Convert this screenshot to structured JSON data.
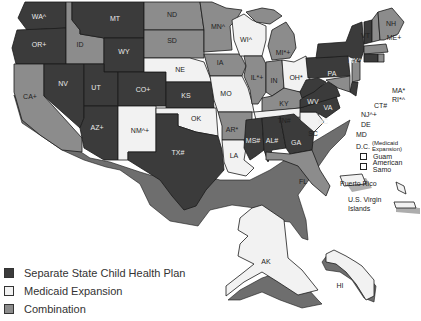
{
  "colors": {
    "separate": "#3b3b3b",
    "medicaid": "#f2f2f2",
    "combination": "#8c8c8c",
    "edge": "#1a1a1a",
    "side_shade": "#6e6e6e"
  },
  "legend": {
    "items": [
      {
        "key": "separate",
        "label": "Separate State Child Health Plan"
      },
      {
        "key": "medicaid",
        "label": "Medicaid Expansion"
      },
      {
        "key": "combination",
        "label": "Combination"
      }
    ]
  },
  "states": [
    {
      "code": "WA",
      "label": "WA^",
      "type": "separate"
    },
    {
      "code": "OR",
      "label": "OR+",
      "type": "separate"
    },
    {
      "code": "CA",
      "label": "CA+",
      "type": "combination"
    },
    {
      "code": "ID",
      "label": "ID",
      "type": "combination"
    },
    {
      "code": "NV",
      "label": "NV",
      "type": "separate"
    },
    {
      "code": "MT",
      "label": "MT",
      "type": "separate"
    },
    {
      "code": "WY",
      "label": "WY",
      "type": "separate"
    },
    {
      "code": "UT",
      "label": "UT",
      "type": "separate"
    },
    {
      "code": "AZ",
      "label": "AZ+",
      "type": "separate"
    },
    {
      "code": "CO",
      "label": "CO+",
      "type": "separate"
    },
    {
      "code": "NM",
      "label": "NM^+",
      "type": "medicaid"
    },
    {
      "code": "ND",
      "label": "ND",
      "type": "combination"
    },
    {
      "code": "SD",
      "label": "SD",
      "type": "combination"
    },
    {
      "code": "NE",
      "label": "NE",
      "type": "medicaid"
    },
    {
      "code": "KS",
      "label": "KS",
      "type": "separate"
    },
    {
      "code": "OK",
      "label": "OK",
      "type": "medicaid"
    },
    {
      "code": "TX",
      "label": "TX#",
      "type": "separate"
    },
    {
      "code": "MN",
      "label": "MN^",
      "type": "combination"
    },
    {
      "code": "IA",
      "label": "IA",
      "type": "combination"
    },
    {
      "code": "MO",
      "label": "MO",
      "type": "medicaid"
    },
    {
      "code": "AR",
      "label": "AR*",
      "type": "combination"
    },
    {
      "code": "LA",
      "label": "LA",
      "type": "medicaid"
    },
    {
      "code": "WI",
      "label": "WI^",
      "type": "medicaid"
    },
    {
      "code": "IL",
      "label": "IL*+",
      "type": "combination"
    },
    {
      "code": "MI",
      "label": "MI*+",
      "type": "combination"
    },
    {
      "code": "IN",
      "label": "IN",
      "type": "combination"
    },
    {
      "code": "OH",
      "label": "OH*",
      "type": "medicaid"
    },
    {
      "code": "KY",
      "label": "KY",
      "type": "combination"
    },
    {
      "code": "TN",
      "label": "TN#",
      "type": "medicaid"
    },
    {
      "code": "MS",
      "label": "MS#",
      "type": "separate"
    },
    {
      "code": "AL",
      "label": "AL#",
      "type": "separate"
    },
    {
      "code": "GA",
      "label": "GA",
      "type": "separate"
    },
    {
      "code": "FL",
      "label": "FL",
      "type": "combination"
    },
    {
      "code": "SC",
      "label": "SC",
      "type": "medicaid"
    },
    {
      "code": "NC",
      "label": "NC",
      "type": "separate"
    },
    {
      "code": "VA",
      "label": "VA",
      "type": "separate"
    },
    {
      "code": "WV",
      "label": "WV",
      "type": "separate"
    },
    {
      "code": "PA",
      "label": "PA",
      "type": "separate"
    },
    {
      "code": "NY",
      "label": "NY^",
      "type": "separate"
    },
    {
      "code": "VT",
      "label": "VT",
      "type": "separate"
    },
    {
      "code": "NH",
      "label": "NH",
      "type": "combination"
    },
    {
      "code": "ME",
      "label": "ME+",
      "type": "combination"
    },
    {
      "code": "MA",
      "label": "MA*",
      "type": "combination"
    },
    {
      "code": "RI",
      "label": "RI*^",
      "type": "combination"
    },
    {
      "code": "CT",
      "label": "CT#",
      "type": "separate"
    },
    {
      "code": "NJ",
      "label": "NJ^+",
      "type": "combination"
    },
    {
      "code": "DE",
      "label": "DE",
      "type": "separate"
    },
    {
      "code": "MD",
      "label": "MD",
      "type": "combination"
    },
    {
      "code": "AK",
      "label": "AK",
      "type": "medicaid"
    },
    {
      "code": "HI",
      "label": "HI",
      "type": "medicaid"
    }
  ],
  "outside_labels": {
    "nh": "NH",
    "vt": "VT",
    "ma": "MA*",
    "ri": "RI*^",
    "ct": "CT#",
    "nj": "NJ^+",
    "de": "DE",
    "md": "MD",
    "dc": "D.C.",
    "dc_note": "(Medicaid Expansion)"
  },
  "territories": [
    {
      "label": "Guam",
      "type": "medicaid"
    },
    {
      "label": "American Samo",
      "type": "medicaid"
    }
  ],
  "islands": {
    "puerto_rico": "Puerto Rico",
    "virgin_islands_line1": "U.S. Virgin",
    "virgin_islands_line2": "Islands"
  }
}
